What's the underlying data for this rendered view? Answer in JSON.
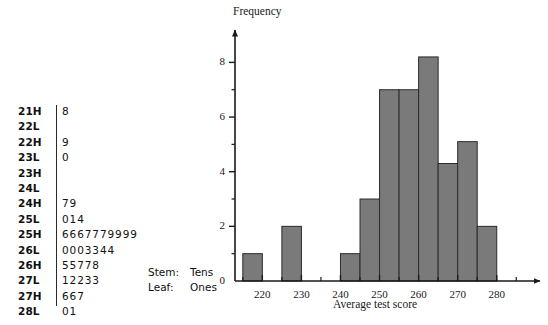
{
  "stemleaf": {
    "key": {
      "stem_label": "Stem:",
      "stem_value": "Tens",
      "leaf_label": "Leaf:",
      "leaf_value": "Ones"
    },
    "rows": [
      {
        "stem": "21H",
        "leaves": "8"
      },
      {
        "stem": "22L",
        "leaves": ""
      },
      {
        "stem": "22H",
        "leaves": "9"
      },
      {
        "stem": "23L",
        "leaves": "0"
      },
      {
        "stem": "23H",
        "leaves": ""
      },
      {
        "stem": "24L",
        "leaves": ""
      },
      {
        "stem": "24H",
        "leaves": "79"
      },
      {
        "stem": "25L",
        "leaves": "014"
      },
      {
        "stem": "25H",
        "leaves": "6667779999"
      },
      {
        "stem": "26L",
        "leaves": "0003344"
      },
      {
        "stem": "26H",
        "leaves": "55778"
      },
      {
        "stem": "27L",
        "leaves": "12233"
      },
      {
        "stem": "27H",
        "leaves": "667"
      },
      {
        "stem": "28L",
        "leaves": "01"
      }
    ]
  },
  "chart_data": {
    "type": "bar",
    "title": "",
    "xlabel": "Average test score",
    "ylabel": "Frequency",
    "xlim": [
      213,
      288
    ],
    "ylim": [
      0,
      8.6
    ],
    "grid": false,
    "legend": null,
    "bin_width": 5,
    "bin_starts": [
      215,
      225,
      240,
      245,
      250,
      255,
      260,
      265,
      270,
      275
    ],
    "categories": [
      "215-220",
      "225-230",
      "240-245",
      "245-250",
      "250-255",
      "255-260",
      "260-265",
      "265-270",
      "270-275",
      "275-280"
    ],
    "values": [
      1,
      2,
      1,
      3,
      7,
      7,
      8.2,
      4.3,
      5.1,
      2
    ],
    "bar_color": "#7a7a7a",
    "bar_edge_color": "#2b2b2b",
    "x_ticks_labeled": [
      220,
      230,
      240,
      250,
      260,
      270,
      280
    ],
    "x_tick_labels": [
      "220",
      "230",
      "240",
      "250",
      "260",
      "270",
      "280"
    ],
    "x_ticks_minor": [
      215,
      225,
      235,
      245,
      255,
      265,
      275,
      285
    ],
    "y_ticks_labeled": [
      0,
      2,
      4,
      6,
      8
    ],
    "y_tick_labels": [
      "0",
      "2",
      "4",
      "6",
      "8"
    ],
    "y_ticks_minor": [
      1,
      3,
      5,
      7
    ]
  }
}
